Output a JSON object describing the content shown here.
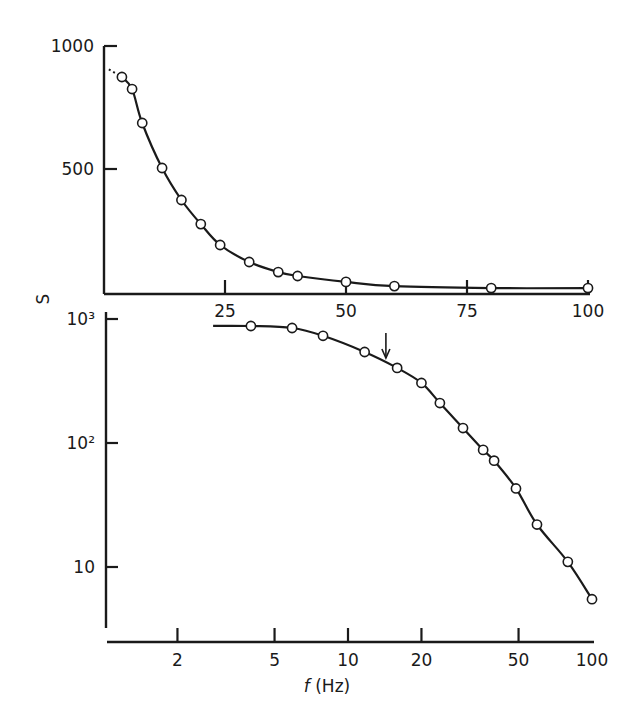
{
  "figure": {
    "shared_ylabel": "S",
    "xlabel_italic": "f",
    "xlabel_unit": " (Hz)"
  },
  "chart_data": [
    {
      "id": "top-linear",
      "type": "line",
      "title": "",
      "xlabel": "",
      "ylabel": "S",
      "xscale": "linear",
      "yscale": "linear",
      "xlim": [
        0,
        100
      ],
      "ylim": [
        0,
        1000
      ],
      "grid": false,
      "legend": null,
      "x_ticks": [
        {
          "value": 25,
          "label": "25"
        },
        {
          "value": 50,
          "label": "50"
        },
        {
          "value": 75,
          "label": "75"
        },
        {
          "value": 100,
          "label": "100"
        }
      ],
      "y_ticks": [
        {
          "value": 500,
          "label": "500"
        },
        {
          "value": 1000,
          "label": "1000"
        }
      ],
      "series": [
        {
          "name": "S vs f (linear)",
          "marker": "open-circle",
          "x": [
            3.7,
            5.8,
            7.9,
            12,
            16,
            20,
            24,
            30,
            36,
            40,
            50,
            60,
            80,
            100
          ],
          "y": [
            874,
            825,
            687,
            504,
            374,
            276,
            191,
            122,
            81,
            65,
            41,
            24,
            16,
            16
          ]
        }
      ],
      "extrapolation": {
        "style": "dotted",
        "x": [
          1,
          3.7
        ],
        "y": [
          905,
          874
        ]
      }
    },
    {
      "id": "bottom-log",
      "type": "line",
      "title": "",
      "xlabel": "f (Hz)",
      "ylabel": "S",
      "xscale": "log",
      "yscale": "log",
      "xlim": [
        1,
        100
      ],
      "ylim": [
        4,
        1000
      ],
      "grid": false,
      "legend": null,
      "x_ticks": [
        {
          "value": 2,
          "label": "2"
        },
        {
          "value": 5,
          "label": "5"
        },
        {
          "value": 10,
          "label": "10"
        },
        {
          "value": 20,
          "label": "20"
        },
        {
          "value": 50,
          "label": "50"
        },
        {
          "value": 100,
          "label": "100"
        }
      ],
      "y_ticks": [
        {
          "value": 10,
          "label": "10"
        },
        {
          "value": 100,
          "label": "10²"
        },
        {
          "value": 1000,
          "label": "10³"
        }
      ],
      "series": [
        {
          "name": "S vs f (log-log)",
          "marker": "open-circle",
          "x": [
            4,
            5.9,
            7.9,
            11.7,
            15.9,
            20,
            23.8,
            29.6,
            35.8,
            39.7,
            48.8,
            59.5,
            79.6,
            100
          ],
          "y": [
            878,
            846,
            732,
            542,
            403,
            305,
            210,
            132,
            88,
            72,
            43,
            22,
            11,
            5.5
          ]
        }
      ],
      "curve_start": {
        "x": 2.8,
        "y": 880
      },
      "annotations": [
        {
          "type": "arrow",
          "direction": "down",
          "x": 14.3,
          "y": 450,
          "label": ""
        }
      ]
    }
  ]
}
